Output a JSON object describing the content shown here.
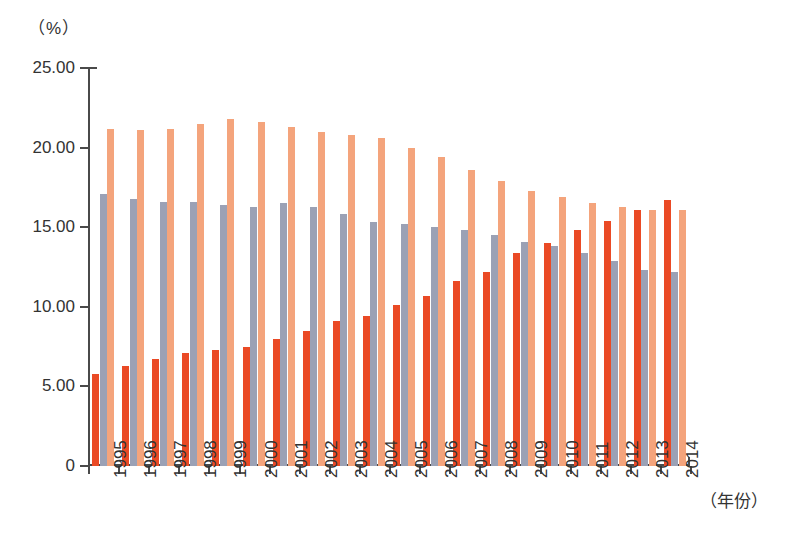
{
  "chart_data": {
    "type": "bar",
    "title": "",
    "subtitle": "",
    "xlabel": "（年份）",
    "ylabel": "（%）",
    "yunit": "（%）",
    "ylim": [
      0,
      25
    ],
    "yticks": [
      0,
      5,
      10,
      15,
      20,
      25
    ],
    "ytick_labels": [
      "0",
      "5.00",
      "10.00",
      "15.00",
      "20.00",
      "25.00"
    ],
    "grid": false,
    "legend": "none",
    "categories": [
      "1995",
      "1996",
      "1997",
      "1998",
      "1999",
      "2000",
      "2001",
      "2002",
      "2003",
      "2004",
      "2005",
      "2006",
      "2007",
      "2008",
      "2009",
      "2010",
      "2011",
      "2012",
      "2013",
      "2014"
    ],
    "series": [
      {
        "name": "series-1",
        "color": "#ea4a25",
        "values": [
          5.8,
          6.3,
          6.7,
          7.1,
          7.3,
          7.5,
          8.0,
          8.5,
          9.1,
          9.4,
          10.1,
          10.7,
          11.6,
          12.2,
          13.4,
          14.0,
          14.8,
          15.4,
          16.1,
          16.7
        ]
      },
      {
        "name": "series-2",
        "color": "#9ba1b5",
        "values": [
          17.1,
          16.8,
          16.6,
          16.6,
          16.4,
          16.3,
          16.5,
          16.3,
          15.8,
          15.3,
          15.2,
          15.0,
          14.8,
          14.5,
          14.1,
          13.8,
          13.4,
          12.9,
          12.3,
          12.2
        ]
      },
      {
        "name": "series-3",
        "color": "#f4a47c",
        "values": [
          21.2,
          21.1,
          21.2,
          21.5,
          21.8,
          21.6,
          21.3,
          21.0,
          20.8,
          20.6,
          20.0,
          19.4,
          18.6,
          17.9,
          17.3,
          16.9,
          16.5,
          16.3,
          16.1,
          16.1
        ]
      }
    ]
  },
  "axis": {
    "y_unit_label": "（%）",
    "x_title_label": "（年份）"
  }
}
